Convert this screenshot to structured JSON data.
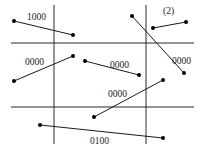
{
  "diagram": {
    "title_tag": "(2)",
    "grid": {
      "vertical_lines": [
        {
          "x": 54,
          "y1": 5,
          "y2": 144
        },
        {
          "x": 146,
          "y1": 5,
          "y2": 144
        }
      ],
      "horizontal_lines": [
        {
          "y": 43,
          "x1": 11,
          "x2": 194
        },
        {
          "y": 107,
          "x1": 11,
          "x2": 194
        }
      ]
    },
    "segments": [
      {
        "id": "s1",
        "x1": 14,
        "y1": 21,
        "x2": 73,
        "y2": 35,
        "label": "1000",
        "lx": 27,
        "ly": 20
      },
      {
        "id": "s2",
        "x1": 14,
        "y1": 81,
        "x2": 73,
        "y2": 56,
        "label": "0000",
        "lx": 25,
        "ly": 65
      },
      {
        "id": "s3",
        "x1": 85,
        "y1": 61,
        "x2": 139,
        "y2": 75,
        "label": "0000",
        "lx": 110,
        "ly": 68
      },
      {
        "id": "s4",
        "x1": 132,
        "y1": 16,
        "x2": 184,
        "y2": 73,
        "label": "0000",
        "lx": 172,
        "ly": 64
      },
      {
        "id": "s5",
        "x1": 153,
        "y1": 28,
        "x2": 186,
        "y2": 22,
        "label": "",
        "lx": 0,
        "ly": 0
      },
      {
        "id": "s6",
        "x1": 94,
        "y1": 117,
        "x2": 163,
        "y2": 80,
        "label": "0000",
        "lx": 108,
        "ly": 97
      },
      {
        "id": "s7",
        "x1": 40,
        "y1": 125,
        "x2": 163,
        "y2": 138,
        "label": "0100",
        "lx": 90,
        "ly": 144
      }
    ],
    "labels": {
      "s1": "1000",
      "s2": "0000",
      "s3": "0000",
      "s4": "0000",
      "s6": "0000",
      "s7": "0100",
      "tag": "(2)"
    }
  }
}
